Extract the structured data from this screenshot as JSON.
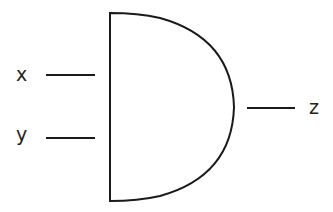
{
  "diagram": {
    "type": "logic-gate",
    "gate": "AND",
    "inputs": [
      {
        "label": "x"
      },
      {
        "label": "y"
      }
    ],
    "output": {
      "label": "z"
    },
    "colors": {
      "stroke": "#1a1a1a",
      "background": "#ffffff",
      "text": "#222222"
    }
  }
}
